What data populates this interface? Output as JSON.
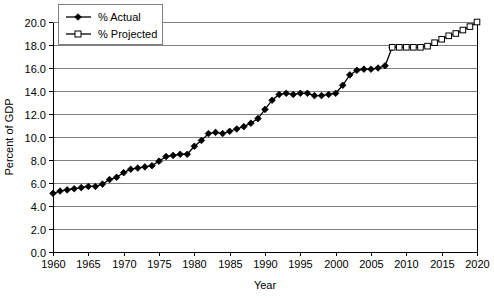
{
  "chart_data": {
    "type": "line",
    "title": "",
    "xlabel": "Year",
    "ylabel": "Percent of GDP",
    "xlim": [
      1960,
      2020
    ],
    "ylim": [
      0.0,
      20.0
    ],
    "grid": true,
    "legend_position": "top-left",
    "x_ticks": [
      "1960",
      "1965",
      "1970",
      "1975",
      "1980",
      "1985",
      "1990",
      "1995",
      "2000",
      "2005",
      "2010",
      "2015",
      "2020"
    ],
    "y_ticks": [
      "0.0",
      "2.0",
      "4.0",
      "6.0",
      "8.0",
      "10.0",
      "12.0",
      "14.0",
      "16.0",
      "18.0",
      "20.0"
    ],
    "series": [
      {
        "name": "% Actual",
        "marker": "filled-diamond",
        "x": [
          1960,
          1961,
          1962,
          1963,
          1964,
          1965,
          1966,
          1967,
          1968,
          1969,
          1970,
          1971,
          1972,
          1973,
          1974,
          1975,
          1976,
          1977,
          1978,
          1979,
          1980,
          1981,
          1982,
          1983,
          1984,
          1985,
          1986,
          1987,
          1988,
          1989,
          1990,
          1991,
          1992,
          1993,
          1994,
          1995,
          1996,
          1997,
          1998,
          1999,
          2000,
          2001,
          2002,
          2003,
          2004,
          2005,
          2006,
          2007,
          2008
        ],
        "values": [
          5.1,
          5.3,
          5.4,
          5.5,
          5.6,
          5.7,
          5.7,
          5.9,
          6.3,
          6.5,
          6.9,
          7.2,
          7.3,
          7.4,
          7.5,
          7.9,
          8.3,
          8.4,
          8.5,
          8.5,
          9.2,
          9.7,
          10.3,
          10.4,
          10.3,
          10.5,
          10.7,
          10.9,
          11.2,
          11.6,
          12.4,
          13.2,
          13.7,
          13.8,
          13.7,
          13.8,
          13.8,
          13.6,
          13.6,
          13.7,
          13.8,
          14.5,
          15.4,
          15.8,
          15.9,
          15.9,
          16.0,
          16.2,
          17.8
        ]
      },
      {
        "name": "% Projected",
        "marker": "open-square",
        "x": [
          2008,
          2009,
          2010,
          2011,
          2012,
          2013,
          2014,
          2015,
          2016,
          2017,
          2018,
          2019,
          2020
        ],
        "values": [
          17.8,
          17.8,
          17.8,
          17.8,
          17.8,
          17.9,
          18.2,
          18.5,
          18.8,
          19.0,
          19.3,
          19.6,
          20.0
        ]
      }
    ]
  },
  "legend": {
    "items": [
      {
        "label": "% Actual"
      },
      {
        "label": "% Projected"
      }
    ]
  },
  "colors": {
    "series_stroke": "#000000",
    "gridline": "#808080",
    "axis": "#000000",
    "background": "#ffffff"
  }
}
